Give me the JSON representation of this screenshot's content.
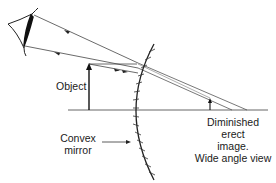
{
  "diagram": {
    "labels": {
      "object": "Object",
      "mirror_line1": "Convex",
      "mirror_line2": "mirror",
      "image_line1": "Diminished",
      "image_line2": "erect",
      "image_line3": "image.",
      "image_line4": "Wide angle view"
    },
    "elements": {
      "eye": "eye-icon",
      "object_arrow": "upward arrow",
      "image_arrow": "small upward arrow",
      "mirror": "convex mirror arc with hatching",
      "principal_axis": "horizontal line"
    },
    "colors": {
      "line": "#333333",
      "text": "#1a1a1a",
      "background": "#ffffff"
    }
  }
}
